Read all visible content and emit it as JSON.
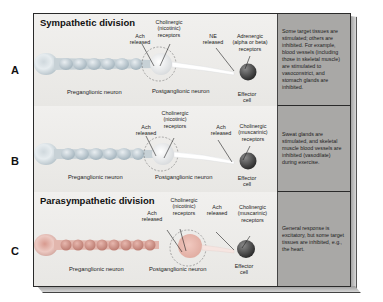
{
  "figure": {
    "rows": [
      {
        "letter": "A",
        "division_title": "Sympathetic division",
        "labels": {
          "pre_release": [
            "Ach",
            "released"
          ],
          "ganglion_receptor": [
            "Cholinergic",
            "(nicotinic)",
            "receptors"
          ],
          "post_release": [
            "NE",
            "released"
          ],
          "effector_receptor": [
            "Adrenergic",
            "(alpha or beta)",
            "receptors"
          ],
          "preganglionic": "Preganglionic neuron",
          "postganglionic": "Postganglionic neuron",
          "effector": [
            "Effector",
            "cell"
          ]
        },
        "description": "Some target tissues are stimulated; others are inhibited. For example, blood vessels (including those in skeletal muscle) are stimulated to vasoconstrict, and stomach glands are inhibited."
      },
      {
        "letter": "B",
        "division_title": "",
        "labels": {
          "pre_release": [
            "Ach",
            "released"
          ],
          "ganglion_receptor": [
            "Cholinergic",
            "(nicotinic)",
            "receptors"
          ],
          "post_release": [
            "Ach",
            "released"
          ],
          "effector_receptor": [
            "Cholinergic",
            "(muscarinic)",
            "receptors"
          ],
          "preganglionic": "Preganglionic neuron",
          "postganglionic": "Postganglionic neuron",
          "effector": [
            "Effector",
            "cell"
          ]
        },
        "description": "Sweat glands are stimulated, and skeletal muscle blood vessels are inhibited (vasodilate) during exercise."
      },
      {
        "letter": "C",
        "division_title": "Parasympathetic division",
        "labels": {
          "pre_release": [
            "Ach",
            "released"
          ],
          "ganglion_receptor": [
            "Cholinergic",
            "(nicotinic)",
            "receptors"
          ],
          "post_release": [
            "Ach",
            "released"
          ],
          "effector_receptor": [
            "Cholinergic",
            "(muscarinic)",
            "receptors"
          ],
          "preganglionic": "Preganglionic neuron",
          "postganglionic": "Postganglionic neuron",
          "effector": [
            "Effector",
            "cell"
          ]
        },
        "description": "General response is excitatory, but some target tissues are inhibited, e.g., the heart."
      }
    ],
    "colors": {
      "panel_bg": "#ecebe9",
      "desc_bg": "#a9a8a6",
      "neuron_pre_AB": "#b9c3c9",
      "neuron_pre_C": "#c98a80",
      "effector": "#4a4a4a",
      "border": "#2a2a2a"
    }
  }
}
